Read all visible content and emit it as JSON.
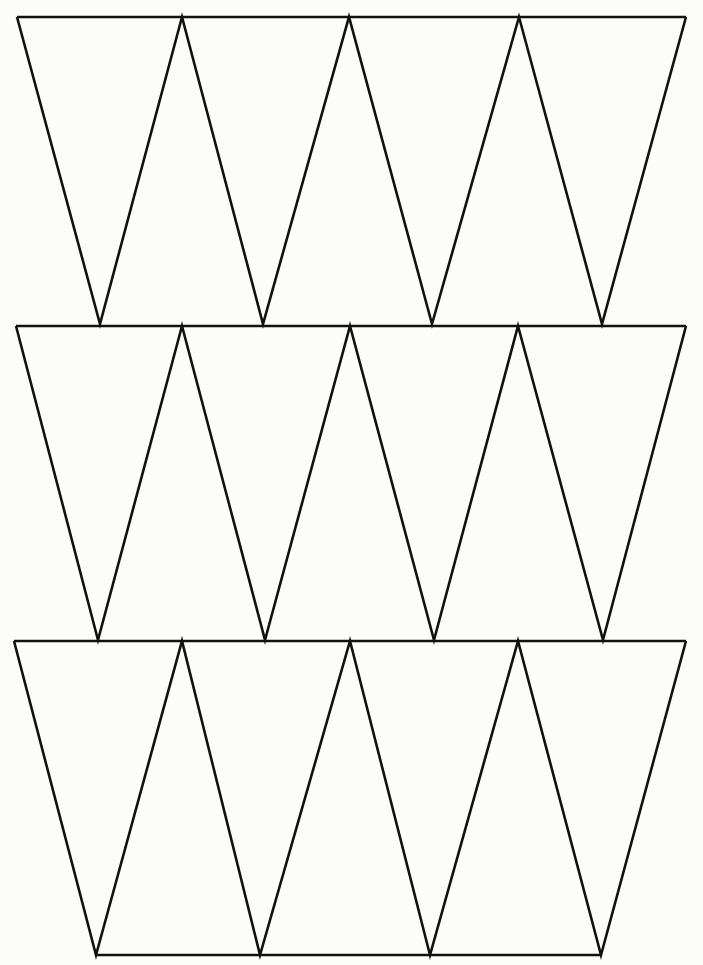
{
  "page": {
    "background": "#fcfcfa",
    "line_color": "#111111"
  },
  "rows": [
    {
      "top_y": 17,
      "bottom_y": 324,
      "top_xs": [
        17,
        182,
        349,
        519,
        686
      ],
      "apex_xs": [
        100,
        263,
        432,
        602
      ]
    },
    {
      "top_y": 326,
      "bottom_y": 640,
      "top_xs": [
        16,
        182,
        350,
        518,
        686
      ],
      "apex_xs": [
        98,
        265,
        434,
        603
      ]
    },
    {
      "top_y": 641,
      "bottom_y": 955,
      "top_xs": [
        14,
        182,
        350,
        518,
        686
      ],
      "apex_xs": [
        96,
        260,
        430,
        601
      ],
      "bottom_line": true
    }
  ]
}
